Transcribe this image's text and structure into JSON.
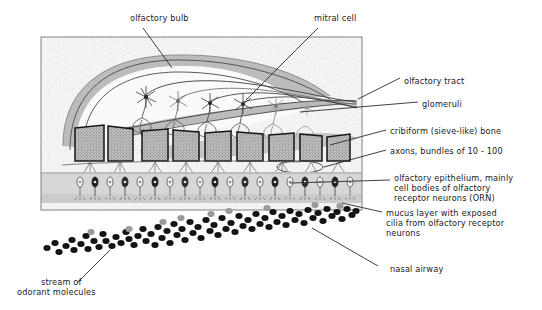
{
  "figure": {
    "title_visible": false,
    "panel": {
      "x": 41,
      "y": 37,
      "w": 321,
      "h": 173,
      "border_color": "#7a7a7a",
      "fill": "#f2f2f2"
    }
  },
  "labels": {
    "olfactory_bulb": "olfactory bulb",
    "mitral_cell": "mitral cell",
    "olfactory_tract": "olfactory tract",
    "glomeruli": "glomeruli",
    "cribiform_bone": "cribiform (sieve-like) bone",
    "axons": "axons, bundles of 10 - 100",
    "olfactory_epithelium_l1": "olfactory epithelium, mainly",
    "olfactory_epithelium_l2": "cell bodies of olfactory",
    "olfactory_epithelium_l3": "receptor neurons (ORN)",
    "mucus_layer_l1": "mucus layer with exposed",
    "mucus_layer_l2": "cilia from olfactory receptor",
    "mucus_layer_l3": "neurons",
    "nasal_airway": "nasal airway",
    "odorant_stream_l1": "stream of",
    "odorant_stream_l2": "odorant molecules"
  },
  "colors": {
    "ink": "#1a1a1a",
    "leader_line": "#2b2b2b",
    "panel_bg": "#f2f2f2",
    "panel_border": "#7a7a7a",
    "bulb_shell": "#b9b9b9",
    "bulb_inner": "#fbfbfb",
    "tract_grey": "#b4b4b4",
    "bone_fill": "#b0b0b0",
    "bone_border": "#1c1c1c",
    "epithelium_band": "#d2d2d2",
    "mucus_band": "#c4c4c4",
    "neuron_line": "#6e6e6e",
    "odorant_dark": "#141414",
    "odorant_light": "#9a9a9a"
  },
  "structures": {
    "bone_blocks_count": 9,
    "mitral_cells_count": 6,
    "glomeruli_count": 6,
    "orn_cells_count": 19,
    "odorant_dot_count": 96
  }
}
